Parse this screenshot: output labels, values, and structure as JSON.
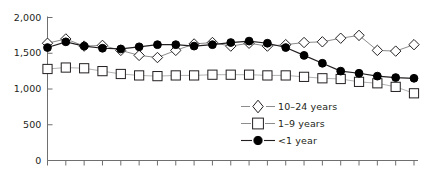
{
  "chart_data": {
    "type": "line",
    "title": "",
    "subtitle": "",
    "xlabel": "",
    "ylabel": "",
    "ylim": [
      0,
      2000
    ],
    "yticks": [
      0,
      500,
      1000,
      1500,
      2000
    ],
    "ytick_labels": [
      "0",
      "500",
      "1,000",
      "1,500",
      "2,000"
    ],
    "grid": false,
    "legend_position": "inside-lower-right",
    "n_points": 21,
    "x": [
      1,
      2,
      3,
      4,
      5,
      6,
      7,
      8,
      9,
      10,
      11,
      12,
      13,
      14,
      15,
      16,
      17,
      18,
      19,
      20,
      21
    ],
    "xtick_labels": [],
    "series": [
      {
        "name": "10–24 years",
        "marker": "open-diamond",
        "color": "#231f20",
        "fill": "#ffffff",
        "values": [
          1640,
          1700,
          1600,
          1610,
          1540,
          1470,
          1440,
          1540,
          1630,
          1650,
          1600,
          1640,
          1600,
          1620,
          1650,
          1660,
          1710,
          1750,
          1540,
          1530,
          1620
        ]
      },
      {
        "name": "1–9 years",
        "marker": "open-square",
        "color": "#8c8c8c",
        "fill": "#ffffff",
        "values": [
          1280,
          1300,
          1290,
          1250,
          1210,
          1190,
          1180,
          1190,
          1190,
          1200,
          1200,
          1200,
          1190,
          1190,
          1170,
          1150,
          1140,
          1100,
          1080,
          1030,
          940
        ]
      },
      {
        "name": "<1 year",
        "marker": "filled-circle",
        "color": "#231f20",
        "fill": "#000000",
        "values": [
          1580,
          1660,
          1600,
          1570,
          1560,
          1590,
          1620,
          1620,
          1600,
          1620,
          1650,
          1670,
          1640,
          1580,
          1470,
          1360,
          1250,
          1220,
          1180,
          1160,
          1150
        ]
      }
    ]
  },
  "legend": {
    "items": [
      {
        "label": "10–24 years",
        "marker": "open-diamond"
      },
      {
        "label": "1–9 years",
        "marker": "open-square"
      },
      {
        "label": "<1 year",
        "marker": "filled-circle"
      }
    ]
  },
  "axis": {
    "y_labels": [
      "2,000",
      "1,500",
      "1,000",
      "500",
      "0"
    ]
  }
}
